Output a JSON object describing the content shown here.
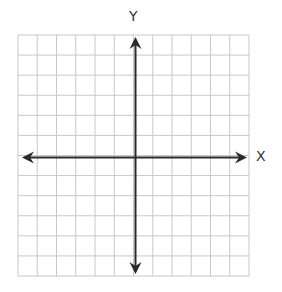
{
  "diagram": {
    "type": "coordinate-plane",
    "x_axis_label": "X",
    "y_axis_label": "Y",
    "grid": {
      "columns": 12,
      "rows": 12,
      "left": 18,
      "top": 35,
      "width": 231,
      "height": 241,
      "line_color": "#c8c8c8"
    },
    "axes": {
      "color": "#2a2a2a",
      "origin_column": 6,
      "origin_row": 6,
      "arrows": [
        "left",
        "right",
        "up",
        "down"
      ]
    }
  }
}
